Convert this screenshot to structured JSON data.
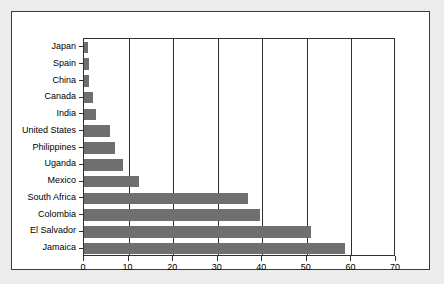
{
  "chart_data": {
    "type": "bar",
    "orientation": "horizontal",
    "title": "",
    "xlabel": "",
    "ylabel": "",
    "xlim": [
      0,
      70
    ],
    "ylim": null,
    "grid": true,
    "legend": null,
    "xticks": [
      0,
      10,
      20,
      30,
      40,
      50,
      60,
      70
    ],
    "categories": [
      "Japan",
      "Spain",
      "China",
      "Canada",
      "India",
      "United States",
      "Philippines",
      "Uganda",
      "Mexico",
      "South Africa",
      "Colombia",
      "El Salvador",
      "Jamaica"
    ],
    "values": [
      1.0,
      1.1,
      1.2,
      2.0,
      2.8,
      5.8,
      7.0,
      8.8,
      12.3,
      36.7,
      39.5,
      51.0,
      58.5
    ],
    "bar_color": "#6f6f70"
  },
  "figure": {
    "background_color": "#ececed",
    "panel_color": "#ffffff",
    "frame_color": "#3a3a42",
    "axis_color": "#2e2e34"
  }
}
